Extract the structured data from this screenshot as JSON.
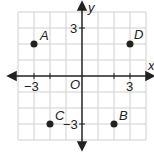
{
  "axes": {
    "x_label": "x",
    "y_label": "y",
    "origin_label": "O"
  },
  "ticks": {
    "x_neg": "−3",
    "x_pos": "3",
    "y_pos": "3",
    "y_neg": "−3"
  },
  "points": [
    {
      "name": "A",
      "x": -3,
      "y": 2
    },
    {
      "name": "B",
      "x": 2,
      "y": -3
    },
    {
      "name": "C",
      "x": -2,
      "y": -3
    },
    {
      "name": "D",
      "x": 3,
      "y": 2
    }
  ],
  "grid": {
    "min": -4,
    "max": 4
  }
}
